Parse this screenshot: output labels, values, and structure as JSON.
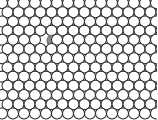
{
  "figure": {
    "name": "hexagonal-close-packed-lattice-with-point-defect",
    "width": 157,
    "height": 120,
    "background_color": "#ffffff",
    "caption": ""
  },
  "lattice": {
    "packing": "hexagonal-close-packed",
    "columns": 15,
    "rows": 13,
    "circle_diameter": 11,
    "circle_radius": 5.5,
    "column_spacing": 11,
    "row_spacing": 9.2,
    "row_offset": 5.5,
    "origin_x": 2,
    "origin_y": 3,
    "stroke_color": "#2b2b2b",
    "stroke_width": 1.05,
    "fill_color": "#ffffff",
    "clipped_edges": [
      "right",
      "bottom"
    ]
  },
  "defect": {
    "label": "shaded-defect-site",
    "description": "single filled grey circle marking a substitutional point defect",
    "fill_color": "#8a8a8a",
    "stroke_color": "#6e6e6e",
    "center_x": 52.5,
    "center_y": 40.4,
    "radius": 5.5,
    "row_index": 4,
    "column_index": 4,
    "count": 1
  },
  "chart_data": {
    "type": "scatter",
    "xlabel": "",
    "ylabel": "",
    "xlim": [
      0,
      157
    ],
    "ylim": [
      0,
      120
    ],
    "grid": false,
    "legend": "none",
    "marker": "circle-outline",
    "marker_diameter": 11,
    "series": [
      {
        "name": "lattice-sites",
        "fill": "#ffffff",
        "stroke": "#2b2b2b",
        "count": 195,
        "note": "15 columns by 13 rows, alternate rows offset by half a column spacing; edge circles clipped at the right and bottom borders"
      },
      {
        "name": "defect-site",
        "fill": "#8a8a8a",
        "stroke": "#6e6e6e",
        "count": 1,
        "x": [
          52.5
        ],
        "y": [
          40.4
        ]
      }
    ]
  }
}
